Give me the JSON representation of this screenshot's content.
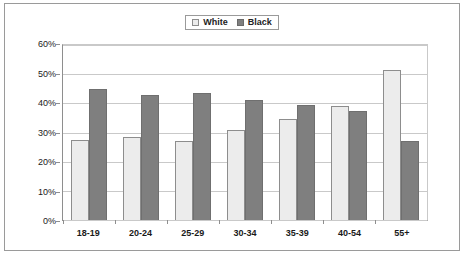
{
  "chart_data": {
    "type": "bar",
    "title": "",
    "xlabel": "",
    "ylabel": "",
    "categories": [
      "18-19",
      "20-24",
      "25-29",
      "30-34",
      "35-39",
      "40-54",
      "55+"
    ],
    "series": [
      {
        "name": "White",
        "color": "#ececec",
        "values": [
          27.5,
          28.5,
          27.0,
          31.0,
          34.5,
          39.0,
          51.5
        ]
      },
      {
        "name": "Black",
        "color": "#7f7f7f",
        "values": [
          45.0,
          43.0,
          43.5,
          41.0,
          39.5,
          37.5,
          27.0
        ]
      }
    ],
    "ylim": [
      0,
      60
    ],
    "ytick_values": [
      60,
      50,
      40,
      30,
      20,
      10,
      0
    ],
    "ytick_labels": [
      "60%",
      "50%",
      "40%",
      "30%",
      "20%",
      "10%",
      "0%"
    ],
    "grid": true,
    "legend_position": "top-center"
  },
  "legend": {
    "entries": [
      {
        "label": "White",
        "swatch": "white-square-icon"
      },
      {
        "label": "Black",
        "swatch": "black-square-icon"
      }
    ]
  },
  "colors": {
    "white_bar": "#ececec",
    "black_bar": "#7f7f7f",
    "gridline": "#c9c9c9",
    "axis": "#8e8e8e",
    "frame_border": "#9a9a9a",
    "background": "#ffffff",
    "text": "#1a1a1a"
  }
}
